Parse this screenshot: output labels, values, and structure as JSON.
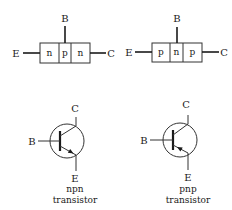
{
  "npn_block": {
    "base_label": "B",
    "emitter_label": "E",
    "collector_label": "C",
    "regions": [
      "n",
      "p",
      "n"
    ]
  },
  "pnp_block": {
    "base_label": "B",
    "emitter_label": "E",
    "collector_label": "C",
    "regions": [
      "p",
      "n",
      "p"
    ]
  },
  "npn_symbol": {
    "base_label": "B",
    "collector_label": "C",
    "emitter_label": "E",
    "caption_line1": "npn",
    "caption_line2": "transistor",
    "arrow_direction": "outward"
  },
  "pnp_symbol": {
    "base_label": "B",
    "collector_label": "C",
    "emitter_label": "E",
    "caption_line1": "pnp",
    "caption_line2": "transistor",
    "arrow_direction": "inward"
  },
  "colors": {
    "ink": "#1a1a1a",
    "background": "#ffffff"
  }
}
